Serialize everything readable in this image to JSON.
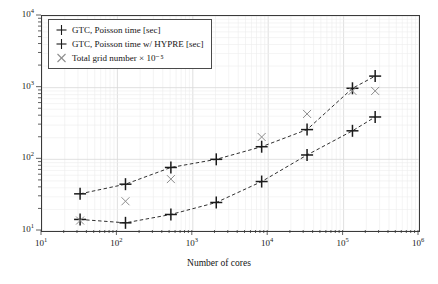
{
  "chart_data": {
    "type": "scatter",
    "title": "",
    "xlabel": "Number of cores",
    "ylabel": "",
    "xscale": "log",
    "yscale": "log",
    "xlim": [
      10,
      1000000
    ],
    "ylim": [
      10,
      10000
    ],
    "grid": true,
    "legend_position": "upper left",
    "x": [
      32,
      128,
      512,
      2048,
      8192,
      32768,
      131072,
      262144
    ],
    "series": [
      {
        "name": "GTC, Poisson time [sec]",
        "marker": "plus",
        "linestyle": "dashed",
        "color": "#1a1a1a",
        "values": [
          33,
          45,
          77,
          100,
          150,
          260,
          980,
          1450
        ]
      },
      {
        "name": "GTC, Poisson time w/ HYPRE [sec]",
        "marker": "plus",
        "linestyle": "dashed",
        "color": "#1a1a1a",
        "values": [
          14.5,
          13,
          17,
          25,
          49,
          115,
          250,
          390
        ]
      },
      {
        "name": "Total grid number × 10⁻⁵",
        "marker": "cross",
        "linestyle": "none",
        "color": "#8c8c8c",
        "values": [
          14,
          26,
          53,
          null,
          205,
          430,
          900,
          900
        ]
      }
    ],
    "xticks": [
      {
        "value": 10,
        "label": "10",
        "exp": "1"
      },
      {
        "value": 100,
        "label": "10",
        "exp": "2"
      },
      {
        "value": 1000,
        "label": "10",
        "exp": "3"
      },
      {
        "value": 10000,
        "label": "10",
        "exp": "4"
      },
      {
        "value": 100000,
        "label": "10",
        "exp": "5"
      },
      {
        "value": 1000000,
        "label": "10",
        "exp": "6"
      }
    ],
    "yticks": [
      {
        "value": 10,
        "label": "10",
        "exp": "1"
      },
      {
        "value": 100,
        "label": "10",
        "exp": "2"
      },
      {
        "value": 1000,
        "label": "10",
        "exp": "3"
      },
      {
        "value": 10000,
        "label": "10",
        "exp": "4"
      }
    ]
  },
  "legend": {
    "items": [
      {
        "label": "GTC, Poisson time [sec]",
        "marker": "plus-icon"
      },
      {
        "label": "GTC, Poisson time w/ HYPRE [sec]",
        "marker": "plus-icon"
      },
      {
        "label": "Total grid number × 10⁻⁵",
        "marker": "cross-icon"
      }
    ]
  },
  "axes": {
    "xlabel": "Number of cores"
  },
  "colors": {
    "frame": "#3a3a3a",
    "major_grid": "#d8d8d8",
    "minor_grid": "#ededed",
    "series_dark": "#1a1a1a",
    "series_gray": "#8c8c8c",
    "background": "#ffffff"
  }
}
